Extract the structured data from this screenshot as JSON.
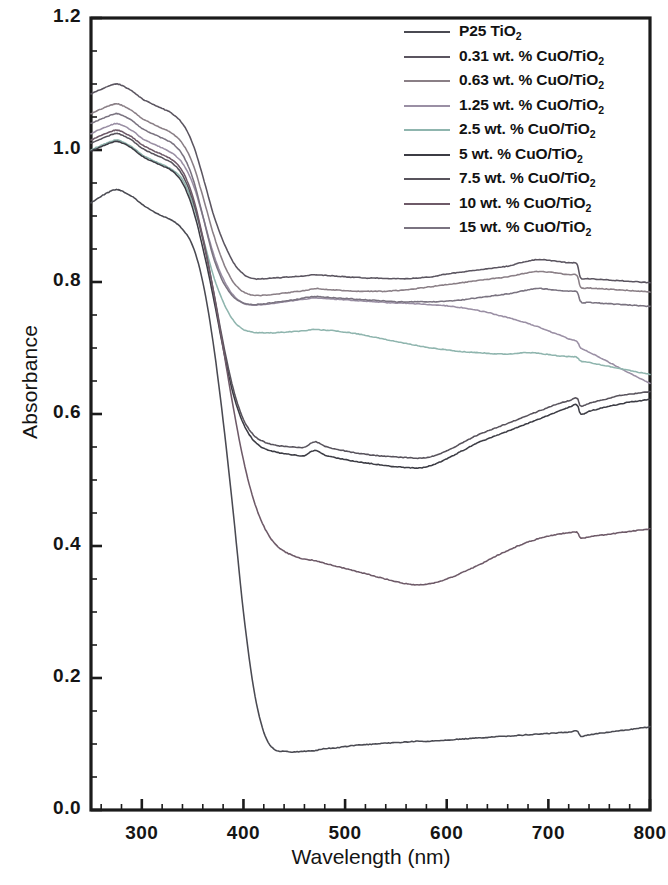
{
  "figure": {
    "title": "",
    "background": "#ffffff"
  },
  "axes": {
    "xlabel": "Wavelength (nm)",
    "ylabel": "Absorbance",
    "x_ticks": [
      "300",
      "400",
      "500",
      "600",
      "700",
      "800"
    ],
    "y_ticks": [
      "0.0",
      "0.2",
      "0.4",
      "0.6",
      "0.8",
      "1.0",
      "1.2"
    ]
  },
  "legend": {
    "position": "top-right",
    "entries": [
      {
        "label": "P25 TiO",
        "sub": "2",
        "suffix": "",
        "color": "#4a4a52"
      },
      {
        "label": "0.31 wt. % CuO/TiO",
        "sub": "2",
        "suffix": "",
        "color": "#5b5560"
      },
      {
        "label": "0.63 wt. % CuO/TiO",
        "sub": "2",
        "suffix": "",
        "color": "#8a7f86"
      },
      {
        "label": "1.25 wt. % CuO/TiO",
        "sub": "2",
        "suffix": "",
        "color": "#9a8fa4"
      },
      {
        "label": "2.5 wt. % CuO/TiO",
        "sub": "2",
        "suffix": "",
        "color": "#8fb5ae"
      },
      {
        "label": "5 wt. % CuO/TiO",
        "sub": "2",
        "suffix": "",
        "color": "#3c3c44"
      },
      {
        "label": "7.5 wt. % CuO/TiO",
        "sub": "2",
        "suffix": "",
        "color": "#58535c"
      },
      {
        "label": "10 wt. % CuO/TiO",
        "sub": "2",
        "suffix": "",
        "color": "#6e5a68"
      },
      {
        "label": "15 wt. % CuO/TiO",
        "sub": "2",
        "suffix": "",
        "color": "#7a7380"
      }
    ]
  },
  "chart_data": {
    "type": "line",
    "title": "",
    "xlabel": "Wavelength (nm)",
    "ylabel": "Absorbance",
    "xlim": [
      250,
      800
    ],
    "ylim": [
      0.0,
      1.2
    ],
    "xticks": [
      300,
      400,
      500,
      600,
      700,
      800
    ],
    "yticks": [
      0.0,
      0.2,
      0.4,
      0.6,
      0.8,
      1.0,
      1.2
    ],
    "grid": false,
    "legend_position": "upper right",
    "x": [
      250,
      260,
      270,
      275,
      280,
      290,
      300,
      310,
      320,
      330,
      340,
      350,
      360,
      370,
      380,
      390,
      400,
      410,
      420,
      430,
      440,
      450,
      460,
      470,
      480,
      490,
      500,
      510,
      520,
      530,
      540,
      550,
      560,
      570,
      580,
      590,
      600,
      610,
      620,
      630,
      640,
      650,
      660,
      670,
      680,
      690,
      700,
      710,
      720,
      728,
      732,
      740,
      750,
      760,
      770,
      780,
      790,
      800
    ],
    "series": [
      {
        "name": "P25 TiO2",
        "color": "#4a4a52",
        "values": [
          0.92,
          0.93,
          0.938,
          0.94,
          0.938,
          0.93,
          0.918,
          0.908,
          0.9,
          0.893,
          0.88,
          0.855,
          0.8,
          0.71,
          0.59,
          0.45,
          0.3,
          0.185,
          0.118,
          0.092,
          0.089,
          0.088,
          0.089,
          0.09,
          0.093,
          0.094,
          0.096,
          0.098,
          0.099,
          0.1,
          0.101,
          0.102,
          0.103,
          0.104,
          0.104,
          0.105,
          0.106,
          0.107,
          0.108,
          0.109,
          0.11,
          0.111,
          0.112,
          0.113,
          0.114,
          0.115,
          0.116,
          0.117,
          0.118,
          0.12,
          0.112,
          0.114,
          0.116,
          0.118,
          0.12,
          0.122,
          0.124,
          0.126
        ]
      },
      {
        "name": "0.31 wt. % CuO/TiO2",
        "color": "#5b5560",
        "values": [
          1.085,
          1.092,
          1.098,
          1.1,
          1.098,
          1.09,
          1.078,
          1.07,
          1.063,
          1.055,
          1.04,
          1.01,
          0.96,
          0.905,
          0.862,
          0.83,
          0.812,
          0.805,
          0.805,
          0.806,
          0.807,
          0.808,
          0.809,
          0.811,
          0.81,
          0.809,
          0.808,
          0.807,
          0.806,
          0.806,
          0.805,
          0.805,
          0.805,
          0.806,
          0.807,
          0.809,
          0.812,
          0.814,
          0.816,
          0.818,
          0.82,
          0.822,
          0.824,
          0.828,
          0.832,
          0.834,
          0.833,
          0.831,
          0.829,
          0.827,
          0.806,
          0.805,
          0.804,
          0.803,
          0.802,
          0.801,
          0.8,
          0.799
        ]
      },
      {
        "name": "0.63 wt. % CuO/TiO2",
        "color": "#8a7f86",
        "values": [
          1.055,
          1.062,
          1.068,
          1.07,
          1.068,
          1.06,
          1.048,
          1.04,
          1.033,
          1.025,
          1.01,
          0.98,
          0.93,
          0.875,
          0.83,
          0.8,
          0.785,
          0.78,
          0.78,
          0.781,
          0.783,
          0.785,
          0.787,
          0.79,
          0.789,
          0.788,
          0.787,
          0.786,
          0.786,
          0.786,
          0.786,
          0.787,
          0.788,
          0.79,
          0.792,
          0.794,
          0.796,
          0.798,
          0.8,
          0.802,
          0.804,
          0.806,
          0.808,
          0.811,
          0.814,
          0.816,
          0.815,
          0.813,
          0.811,
          0.81,
          0.792,
          0.791,
          0.79,
          0.789,
          0.788,
          0.787,
          0.786,
          0.785
        ]
      },
      {
        "name": "1.25 wt. % CuO/TiO2",
        "color": "#9a8fa4",
        "values": [
          1.025,
          1.032,
          1.038,
          1.04,
          1.038,
          1.03,
          1.018,
          1.01,
          1.003,
          0.995,
          0.98,
          0.95,
          0.9,
          0.845,
          0.805,
          0.78,
          0.768,
          0.765,
          0.766,
          0.768,
          0.77,
          0.772,
          0.774,
          0.776,
          0.775,
          0.774,
          0.773,
          0.772,
          0.771,
          0.77,
          0.769,
          0.768,
          0.768,
          0.767,
          0.766,
          0.765,
          0.764,
          0.762,
          0.76,
          0.757,
          0.754,
          0.75,
          0.746,
          0.742,
          0.737,
          0.732,
          0.726,
          0.72,
          0.714,
          0.71,
          0.7,
          0.694,
          0.686,
          0.678,
          0.67,
          0.662,
          0.654,
          0.646
        ]
      },
      {
        "name": "2.5 wt. % CuO/TiO2",
        "color": "#8fb5ae",
        "values": [
          1.0,
          1.007,
          1.013,
          1.015,
          1.013,
          1.005,
          0.993,
          0.985,
          0.978,
          0.97,
          0.955,
          0.92,
          0.868,
          0.812,
          0.77,
          0.742,
          0.728,
          0.724,
          0.723,
          0.723,
          0.724,
          0.725,
          0.726,
          0.728,
          0.727,
          0.726,
          0.724,
          0.722,
          0.719,
          0.716,
          0.713,
          0.71,
          0.707,
          0.704,
          0.701,
          0.699,
          0.697,
          0.695,
          0.694,
          0.693,
          0.692,
          0.691,
          0.691,
          0.692,
          0.693,
          0.692,
          0.69,
          0.688,
          0.687,
          0.686,
          0.68,
          0.678,
          0.675,
          0.672,
          0.669,
          0.666,
          0.663,
          0.66
        ]
      },
      {
        "name": "5 wt. % CuO/TiO2",
        "color": "#3c3c44",
        "values": [
          0.998,
          1.005,
          1.011,
          1.013,
          1.011,
          1.003,
          0.991,
          0.983,
          0.976,
          0.968,
          0.95,
          0.912,
          0.852,
          0.78,
          0.7,
          0.63,
          0.585,
          0.56,
          0.548,
          0.543,
          0.54,
          0.538,
          0.537,
          0.545,
          0.538,
          0.534,
          0.531,
          0.528,
          0.526,
          0.524,
          0.522,
          0.52,
          0.519,
          0.518,
          0.52,
          0.525,
          0.532,
          0.54,
          0.548,
          0.556,
          0.562,
          0.568,
          0.574,
          0.58,
          0.586,
          0.592,
          0.598,
          0.604,
          0.61,
          0.614,
          0.6,
          0.604,
          0.608,
          0.612,
          0.615,
          0.618,
          0.62,
          0.622
        ]
      },
      {
        "name": "7.5 wt. % CuO/TiO2",
        "color": "#58535c",
        "values": [
          1.01,
          1.017,
          1.023,
          1.025,
          1.023,
          1.015,
          1.003,
          0.995,
          0.988,
          0.98,
          0.962,
          0.925,
          0.865,
          0.79,
          0.708,
          0.638,
          0.592,
          0.568,
          0.558,
          0.553,
          0.551,
          0.55,
          0.55,
          0.558,
          0.551,
          0.547,
          0.544,
          0.541,
          0.539,
          0.537,
          0.536,
          0.535,
          0.534,
          0.533,
          0.534,
          0.538,
          0.544,
          0.552,
          0.56,
          0.568,
          0.574,
          0.58,
          0.586,
          0.592,
          0.598,
          0.604,
          0.61,
          0.616,
          0.62,
          0.624,
          0.612,
          0.616,
          0.62,
          0.624,
          0.628,
          0.63,
          0.632,
          0.634
        ]
      },
      {
        "name": "10 wt. % CuO/TiO2",
        "color": "#6e5a68",
        "values": [
          1.015,
          1.022,
          1.028,
          1.03,
          1.028,
          1.02,
          1.008,
          1.0,
          0.993,
          0.985,
          0.968,
          0.93,
          0.868,
          0.79,
          0.7,
          0.61,
          0.53,
          0.47,
          0.43,
          0.405,
          0.392,
          0.385,
          0.38,
          0.378,
          0.374,
          0.37,
          0.366,
          0.362,
          0.358,
          0.354,
          0.35,
          0.346,
          0.343,
          0.341,
          0.342,
          0.345,
          0.35,
          0.356,
          0.363,
          0.37,
          0.378,
          0.386,
          0.393,
          0.4,
          0.406,
          0.411,
          0.415,
          0.418,
          0.42,
          0.421,
          0.412,
          0.414,
          0.416,
          0.418,
          0.42,
          0.422,
          0.424,
          0.426
        ]
      },
      {
        "name": "15 wt. % CuO/TiO2",
        "color": "#7a7380",
        "values": [
          1.04,
          1.047,
          1.053,
          1.055,
          1.053,
          1.045,
          1.033,
          1.025,
          1.018,
          1.01,
          0.993,
          0.958,
          0.9,
          0.84,
          0.8,
          0.778,
          0.768,
          0.766,
          0.767,
          0.769,
          0.771,
          0.773,
          0.776,
          0.778,
          0.777,
          0.776,
          0.775,
          0.774,
          0.773,
          0.772,
          0.771,
          0.77,
          0.77,
          0.77,
          0.77,
          0.77,
          0.771,
          0.772,
          0.774,
          0.776,
          0.778,
          0.78,
          0.782,
          0.785,
          0.788,
          0.79,
          0.789,
          0.787,
          0.786,
          0.785,
          0.77,
          0.769,
          0.768,
          0.767,
          0.766,
          0.765,
          0.764,
          0.763
        ]
      }
    ]
  }
}
